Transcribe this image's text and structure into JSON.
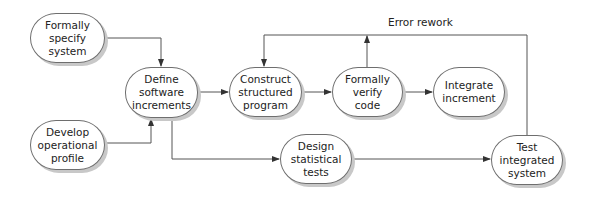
{
  "diagram": {
    "nodes": [
      {
        "id": "formally-specify",
        "lines": [
          "Formally",
          "specify",
          "system"
        ],
        "x": 30,
        "y": 13,
        "w": 75,
        "h": 50
      },
      {
        "id": "develop-profile",
        "lines": [
          "Develop",
          "operational",
          "profile"
        ],
        "x": 30,
        "y": 120,
        "w": 75,
        "h": 50
      },
      {
        "id": "define-increments",
        "lines": [
          "Define",
          "software",
          "increments"
        ],
        "x": 125,
        "y": 67,
        "w": 73,
        "h": 51
      },
      {
        "id": "construct-program",
        "lines": [
          "Construct",
          "structured",
          "program"
        ],
        "x": 229,
        "y": 67,
        "w": 73,
        "h": 50
      },
      {
        "id": "verify-code",
        "lines": [
          "Formally",
          "verify",
          "code"
        ],
        "x": 332,
        "y": 67,
        "w": 71,
        "h": 50
      },
      {
        "id": "integrate-increment",
        "lines": [
          "Integrate",
          "increment"
        ],
        "x": 433,
        "y": 67,
        "w": 72,
        "h": 50
      },
      {
        "id": "design-tests",
        "lines": [
          "Design",
          "statistical",
          "tests"
        ],
        "x": 280,
        "y": 134,
        "w": 72,
        "h": 50
      },
      {
        "id": "test-system",
        "lines": [
          "Test",
          "integrated",
          "system"
        ],
        "x": 491,
        "y": 135,
        "w": 72,
        "h": 50
      }
    ],
    "edges": [
      {
        "from": "formally-specify",
        "to": "define-increments"
      },
      {
        "from": "develop-profile",
        "to": "define-increments"
      },
      {
        "from": "define-increments",
        "to": "construct-program"
      },
      {
        "from": "construct-program",
        "to": "verify-code"
      },
      {
        "from": "verify-code",
        "to": "integrate-increment"
      },
      {
        "from": "define-increments",
        "to": "design-tests"
      },
      {
        "from": "design-tests",
        "to": "test-system"
      },
      {
        "from": "test-system",
        "to": "construct-program",
        "label": "Error rework"
      },
      {
        "from": "verify-code",
        "to": "error-rework-loop"
      }
    ],
    "edge_label": "Error rework",
    "colors": {
      "line": "#555555",
      "border": "#6e6e6e",
      "shadow": "#c8c8c8",
      "text": "#222222"
    }
  }
}
